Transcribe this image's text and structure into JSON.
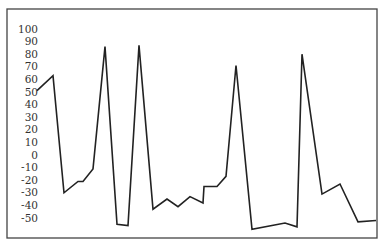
{
  "chart_data": {
    "type": "line",
    "title": "",
    "xlabel": "",
    "ylabel": "",
    "ylim": [
      -60,
      100
    ],
    "yticks": [
      100,
      90,
      80,
      70,
      60,
      50,
      40,
      30,
      20,
      10,
      0,
      -10,
      -20,
      -30,
      -40,
      -50
    ],
    "grid": false,
    "legend": null,
    "line_color": "#222222",
    "x": [
      37,
      53,
      64,
      78,
      83,
      93,
      105,
      117,
      128,
      139,
      153,
      167,
      178,
      190,
      203,
      204,
      217,
      226,
      236,
      252,
      285,
      297,
      302,
      322,
      340,
      358,
      376
    ],
    "series": [
      {
        "name": "series",
        "values": [
          51,
          63,
          -30,
          -21,
          -21,
          -11,
          86,
          -55,
          -56,
          87,
          -43,
          -35,
          -41,
          -33,
          -38,
          -25,
          -25,
          -17,
          71,
          -59,
          -54,
          -57,
          80,
          -31,
          -23,
          -53,
          -52
        ]
      }
    ]
  },
  "layout": {
    "frame": {
      "left": 7,
      "top": 9,
      "right": 377,
      "bottom": 238
    },
    "zero_y": 155,
    "px_per_unit": 1.26,
    "tick_label_right": 38
  }
}
